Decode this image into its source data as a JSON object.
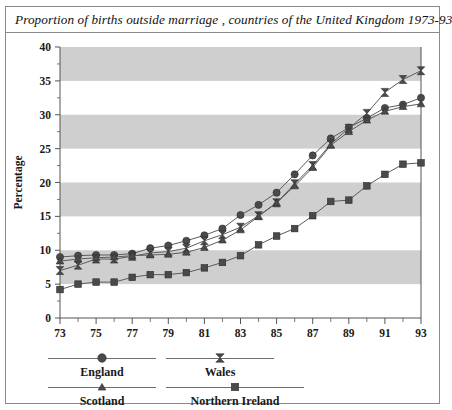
{
  "figure": {
    "title": "Proportion of births outside marriage , countries of the United Kingdom 1973-93"
  },
  "axes": {
    "y_title": "Percentage",
    "x_title": "Years",
    "y_ticks": [
      "0",
      "5",
      "10",
      "15",
      "20",
      "25",
      "30",
      "35",
      "40"
    ],
    "x_ticks": [
      "73",
      "75",
      "77",
      "79",
      "81",
      "83",
      "85",
      "87",
      "89",
      "91",
      "93"
    ]
  },
  "legend": {
    "items": [
      {
        "label": "England",
        "marker": "circle-marker"
      },
      {
        "label": "Wales",
        "marker": "bowtie-marker"
      },
      {
        "label": "Scotland",
        "marker": "triangle-marker"
      },
      {
        "label": "Northern Ireland",
        "marker": "square-marker"
      }
    ]
  },
  "colors": {
    "series": "#4a4a4a",
    "band": "#cfcfcf",
    "axis": "#555555",
    "text": "#1a1a1a"
  },
  "chart_data": {
    "type": "line",
    "title": "Proportion of births outside marriage , countries of the United Kingdom 1973-93",
    "xlabel": "Years",
    "ylabel": "Percentage",
    "xlim": [
      1973,
      1993
    ],
    "ylim": [
      0,
      40
    ],
    "ytick_step": 5,
    "grid": "alternating horizontal gray bands every 5 units",
    "legend_position": "below-plot",
    "x": [
      1973,
      1974,
      1975,
      1976,
      1977,
      1978,
      1979,
      1980,
      1981,
      1982,
      1983,
      1984,
      1985,
      1986,
      1987,
      1988,
      1989,
      1990,
      1991,
      1992,
      1993
    ],
    "series": [
      {
        "name": "England",
        "marker": "circle",
        "values": [
          9.0,
          9.2,
          9.3,
          9.3,
          9.5,
          10.3,
          10.7,
          11.4,
          12.2,
          13.2,
          15.2,
          16.7,
          18.5,
          21.2,
          24.0,
          26.5,
          28.1,
          29.5,
          31.0,
          31.5,
          32.5
        ]
      },
      {
        "name": "Wales",
        "marker": "bowtie",
        "values": [
          7.0,
          7.8,
          8.7,
          8.7,
          9.1,
          9.6,
          9.8,
          10.3,
          11.4,
          12.3,
          13.4,
          15.1,
          17.0,
          19.8,
          22.5,
          25.7,
          28.0,
          30.2,
          33.3,
          35.2,
          36.5
        ]
      },
      {
        "name": "Scotland",
        "marker": "triangle",
        "values": [
          8.4,
          8.7,
          8.9,
          9.0,
          9.2,
          9.3,
          9.4,
          9.7,
          10.4,
          11.5,
          13.0,
          15.0,
          17.0,
          19.5,
          22.2,
          25.5,
          27.5,
          29.2,
          30.5,
          31.2,
          31.6
        ]
      },
      {
        "name": "Northern Ireland",
        "marker": "square",
        "values": [
          4.2,
          5.0,
          5.3,
          5.3,
          6.0,
          6.4,
          6.4,
          6.7,
          7.4,
          8.2,
          9.2,
          10.8,
          12.1,
          13.2,
          15.1,
          17.2,
          17.4,
          19.5,
          21.2,
          22.7,
          22.9
        ]
      }
    ]
  }
}
